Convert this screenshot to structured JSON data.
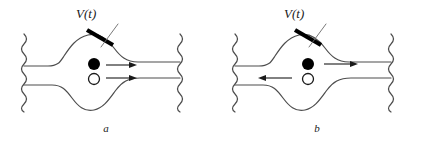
{
  "figure": {
    "background_color": "#ffffff",
    "line_color": "#4d4d4d",
    "dark_line_color": "#1a1a1a",
    "arrow_color": "#1a1a1a",
    "gate_color": "#000000",
    "filled_particle_color": "#000000",
    "open_particle_color": "#ffffff",
    "panels": [
      {
        "id": "a",
        "caption": "a",
        "gate_label": "V(t)",
        "gate_electrode": {
          "name": "gate-electrode-bar",
          "x1": 87,
          "y1": 30,
          "x2": 113,
          "y2": 45,
          "thickness": 4
        },
        "leader_line": {
          "name": "gate-leader-line",
          "x1": 97,
          "y1": 26,
          "x2": 117,
          "y2": 48
        },
        "particles": [
          {
            "name": "filled-particle",
            "type": "filled",
            "cx": 94,
            "cy": 64,
            "r": 6
          },
          {
            "name": "open-particle",
            "type": "open",
            "cx": 94,
            "cy": 79,
            "r": 5.5
          }
        ],
        "arrows": [
          {
            "name": "flow-arrow-upper",
            "direction": "right",
            "x1": 106,
            "y1": 65,
            "x2": 135,
            "y2": 65
          },
          {
            "name": "flow-arrow-lower",
            "direction": "right",
            "x1": 106,
            "y1": 78,
            "x2": 135,
            "y2": 78
          }
        ],
        "edge_squiggles": [
          {
            "name": "left-edge-squiggle",
            "x": 24,
            "y_top": 34,
            "y_bottom": 112
          },
          {
            "name": "right-edge-squiggle",
            "x": 180,
            "y_top": 34,
            "y_bottom": 112
          }
        ]
      },
      {
        "id": "b",
        "caption": "b",
        "gate_label": "V(t)",
        "gate_electrode": {
          "name": "gate-electrode-bar",
          "x1": 84,
          "y1": 30,
          "x2": 110,
          "y2": 45,
          "thickness": 4
        },
        "leader_line": {
          "name": "gate-leader-line",
          "x1": 94,
          "y1": 26,
          "x2": 114,
          "y2": 48
        },
        "particles": [
          {
            "name": "filled-particle",
            "type": "filled",
            "cx": 97,
            "cy": 64,
            "r": 6
          },
          {
            "name": "open-particle",
            "type": "open",
            "cx": 97,
            "cy": 79,
            "r": 5.5
          }
        ],
        "arrows": [
          {
            "name": "flow-arrow-right",
            "direction": "right",
            "x1": 113,
            "y1": 64,
            "x2": 147,
            "y2": 64
          },
          {
            "name": "flow-arrow-left",
            "direction": "left",
            "x1": 79,
            "y1": 78,
            "x2": 47,
            "y2": 78
          }
        ],
        "edge_squiggles": [
          {
            "name": "left-edge-squiggle",
            "x": 24,
            "y_top": 34,
            "y_bottom": 112
          },
          {
            "name": "right-edge-squiggle",
            "x": 180,
            "y_top": 34,
            "y_bottom": 112
          }
        ]
      }
    ]
  }
}
